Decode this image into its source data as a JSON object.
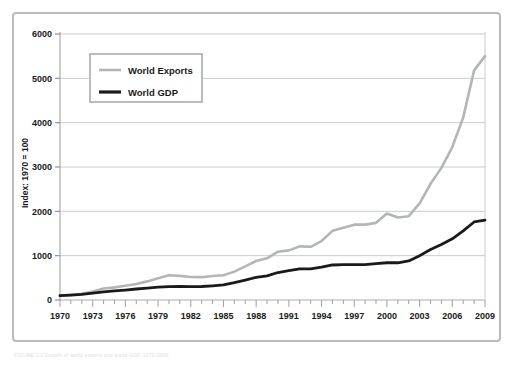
{
  "figure": {
    "caption": "FIGURE 1.1  Growth of world exports and world GDP, 1970-2009"
  },
  "chart_data": {
    "type": "line",
    "title": "",
    "xlabel": "",
    "ylabel": "Index: 1970 = 100",
    "xlim": [
      1970,
      2009
    ],
    "ylim": [
      0,
      6000
    ],
    "yticks": [
      0,
      1000,
      2000,
      3000,
      4000,
      5000,
      6000
    ],
    "xticks": [
      1970,
      1973,
      1976,
      1979,
      1982,
      1985,
      1988,
      1991,
      1994,
      1997,
      2000,
      2003,
      2006,
      2009
    ],
    "xtick_labels": [
      "1970",
      "1973",
      "1976",
      "1979",
      "1982",
      "1985",
      "1988",
      "1991",
      "1994",
      "1997",
      "2000",
      "2003",
      "2006",
      "2009"
    ],
    "ytick_labels": [
      "0",
      "1000",
      "2000",
      "3000",
      "4000",
      "5000",
      "6000"
    ],
    "grid": true,
    "grid_axis": "y",
    "legend_position": "upper-left",
    "x": [
      1970,
      1971,
      1972,
      1973,
      1974,
      1975,
      1976,
      1977,
      1978,
      1979,
      1980,
      1981,
      1982,
      1983,
      1984,
      1985,
      1986,
      1987,
      1988,
      1989,
      1990,
      1991,
      1992,
      1993,
      1994,
      1995,
      1996,
      1997,
      1998,
      1999,
      2000,
      2001,
      2002,
      2003,
      2004,
      2005,
      2006,
      2007,
      2008,
      2009
    ],
    "series": [
      {
        "name": "World Exports",
        "color": "#b3b6b8",
        "values": [
          100,
          115,
          140,
          190,
          260,
          285,
          320,
          360,
          420,
          490,
          560,
          545,
          520,
          515,
          540,
          560,
          640,
          760,
          880,
          940,
          1090,
          1120,
          1210,
          1200,
          1330,
          1560,
          1630,
          1700,
          1700,
          1740,
          1950,
          1860,
          1890,
          2180,
          2620,
          2980,
          3450,
          4120,
          5180,
          5500
        ]
      },
      {
        "name": "World GDP",
        "color": "#1a1a1a",
        "values": [
          100,
          112,
          128,
          155,
          185,
          205,
          225,
          248,
          268,
          290,
          300,
          305,
          300,
          305,
          320,
          340,
          390,
          450,
          510,
          545,
          620,
          660,
          700,
          700,
          740,
          790,
          800,
          800,
          800,
          820,
          840,
          840,
          880,
          1000,
          1140,
          1250,
          1380,
          1560,
          1760,
          1800
        ]
      }
    ]
  },
  "legend": {
    "items": [
      {
        "label": "World Exports",
        "color": "#b3b6b8"
      },
      {
        "label": "World GDP",
        "color": "#1a1a1a"
      }
    ]
  }
}
